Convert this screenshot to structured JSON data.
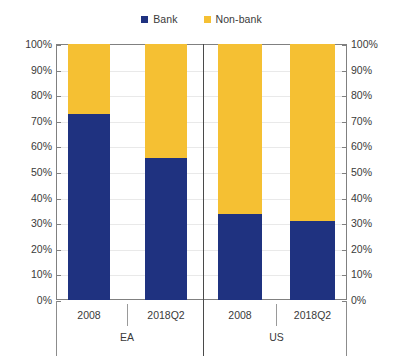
{
  "legend": {
    "position": "top-center",
    "entries": [
      {
        "label": "Bank",
        "color": "#1f3280",
        "icon": "square-marker-icon"
      },
      {
        "label": "Non-bank",
        "color": "#f5c033",
        "icon": "square-marker-icon"
      }
    ]
  },
  "axis": {
    "left": {
      "ticks": [
        "100%",
        "90%",
        "80%",
        "70%",
        "60%",
        "50%",
        "40%",
        "30%",
        "20%",
        "10%",
        "0%"
      ]
    },
    "right": {
      "ticks": [
        "100%",
        "90%",
        "80%",
        "70%",
        "60%",
        "50%",
        "40%",
        "30%",
        "20%",
        "10%",
        "0%"
      ]
    },
    "x_inner": [
      "2008",
      "2018Q2",
      "2008",
      "2018Q2"
    ],
    "x_outer": [
      "EA",
      "US"
    ]
  },
  "chart_data": {
    "type": "bar",
    "subtype": "100% stacked column",
    "title": "",
    "subtitle": "",
    "xlabel": "",
    "ylabel": "",
    "ylim": [
      0,
      100
    ],
    "ytick_step": 10,
    "yunit": "%",
    "grid": true,
    "legend_position": "top-center",
    "dual_y_axis": true,
    "groups": [
      "EA",
      "US"
    ],
    "categories": [
      "2008",
      "2018Q2",
      "2008",
      "2018Q2"
    ],
    "series": [
      {
        "name": "Bank",
        "color": "#1f3280",
        "values": [
          72.5,
          55.5,
          33.5,
          31.0
        ]
      },
      {
        "name": "Non-bank",
        "color": "#f5c033",
        "values": [
          27.5,
          44.5,
          66.5,
          69.0
        ]
      }
    ],
    "points": [
      {
        "group": "EA",
        "category": "2008",
        "bank": 72.5,
        "nonbank": 27.5
      },
      {
        "group": "EA",
        "category": "2018Q2",
        "bank": 55.5,
        "nonbank": 44.5
      },
      {
        "group": "US",
        "category": "2008",
        "bank": 33.5,
        "nonbank": 66.5
      },
      {
        "group": "US",
        "category": "2018Q2",
        "bank": 31.0,
        "nonbank": 69.0
      }
    ]
  },
  "colors": {
    "bank": "#1f3280",
    "nonbank": "#f5c033",
    "axis": "#808080",
    "grid": "#e9e9e9",
    "text": "#3a3a3a",
    "background": "#ffffff"
  }
}
